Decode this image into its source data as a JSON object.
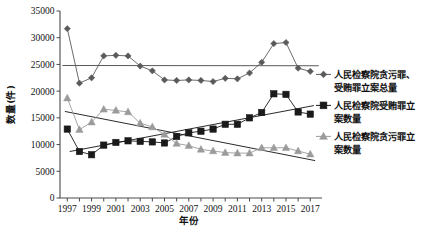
{
  "chart_data": {
    "type": "line",
    "title": "",
    "xlabel": "年份",
    "ylabel": "数量(件)",
    "xlim": [
      1996.4,
      2017.8
    ],
    "ylim": [
      0,
      35000
    ],
    "grid": false,
    "legend_position": "right",
    "x": [
      1997,
      1998,
      1999,
      2000,
      2001,
      2002,
      2003,
      2004,
      2005,
      2006,
      2007,
      2008,
      2009,
      2010,
      2011,
      2012,
      2013,
      2014,
      2015,
      2016,
      2017
    ],
    "xtick_labels": [
      "1997",
      "1999",
      "2001",
      "2003",
      "2005",
      "2007",
      "2009",
      "2011",
      "2013",
      "2015",
      "2017"
    ],
    "xtick_values": [
      1997,
      1999,
      2001,
      2003,
      2005,
      2007,
      2009,
      2011,
      2013,
      2015,
      2017
    ],
    "ytick_labels": [
      "0",
      "5000",
      "10000",
      "15000",
      "20000",
      "25000",
      "30000",
      "35000"
    ],
    "ytick_values": [
      0,
      5000,
      10000,
      15000,
      20000,
      25000,
      30000,
      35000
    ],
    "series": [
      {
        "name": "人民检察院贪污罪、受贿罪立案总量",
        "marker": "diamond",
        "color": "#5a5a5a",
        "values": [
          31700,
          21500,
          22500,
          26600,
          26700,
          26600,
          24700,
          23800,
          22100,
          22000,
          22100,
          22000,
          21800,
          22400,
          22300,
          23400,
          25400,
          28900,
          29100,
          24300,
          23700
        ]
      },
      {
        "name": "人民检察院受贿罪立案数量",
        "marker": "square",
        "color": "#1a1a1a",
        "values": [
          12900,
          8700,
          8100,
          9900,
          10400,
          10700,
          10600,
          10500,
          10300,
          11500,
          12200,
          12500,
          12900,
          13800,
          13800,
          15000,
          16000,
          19500,
          19400,
          16100,
          15700
        ]
      },
      {
        "name": "人民检察院贪污罪立案数量",
        "marker": "triangle",
        "color": "#9b9b9b",
        "values": [
          18700,
          12800,
          14200,
          16600,
          16400,
          16100,
          14000,
          13300,
          11900,
          10200,
          9800,
          9100,
          8800,
          8500,
          8400,
          8400,
          9400,
          9400,
          9400,
          8800,
          8200
        ]
      }
    ],
    "trend_lines": [
      {
        "name": "total-trendline",
        "color": "#5a5a5a",
        "x0": 1996.6,
        "y0": 24800,
        "x1": 2017.7,
        "y1": 24750
      },
      {
        "name": "bribery-trendline",
        "color": "#2a2a2a",
        "x0": 1997.2,
        "y0": 8700,
        "x1": 2017.3,
        "y1": 17300
      },
      {
        "name": "embezzlement-trendline",
        "color": "#2a2a2a",
        "x0": 1996.8,
        "y0": 16200,
        "x1": 2017.4,
        "y1": 7000
      }
    ]
  },
  "legend": {
    "items": [
      {
        "label_line1": "人民检察院贪污罪、",
        "label_line2": "受贿罪立案总量",
        "marker": "diamond",
        "color": "#5a5a5a"
      },
      {
        "label_line1": "人民检察院受贿罪立",
        "label_line2": "案数量",
        "marker": "square",
        "color": "#1a1a1a"
      },
      {
        "label_line1": "人民检察院贪污罪立",
        "label_line2": "案数量",
        "marker": "triangle",
        "color": "#9b9b9b"
      }
    ]
  }
}
